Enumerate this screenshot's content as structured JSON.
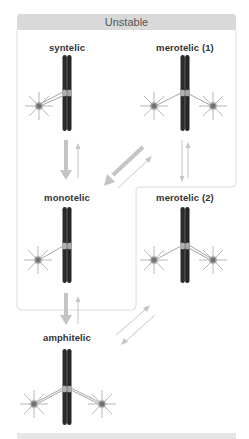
{
  "group": {
    "label": "Unstable",
    "header_color": "#d9d9d9",
    "border_color": "#dcdcdc"
  },
  "states": [
    {
      "id": "syntelic",
      "label": "syntelic",
      "group": "Unstable",
      "attachments": "both sister kinetochores attached to the same pole"
    },
    {
      "id": "merotelic-1",
      "label": "merotelic (1)",
      "group": "Unstable",
      "attachments": "one kinetochore attached to both poles"
    },
    {
      "id": "monotelic",
      "label": "monotelic",
      "group": "Unstable",
      "attachments": "one kinetochore attached to one pole"
    },
    {
      "id": "merotelic-2",
      "label": "merotelic (2)",
      "group": "Unstable",
      "attachments": "both kinetochores attached, one to both poles"
    },
    {
      "id": "amphitelic",
      "label": "amphitelic",
      "group": "Stable",
      "attachments": "sister kinetochores attached to opposite poles"
    }
  ],
  "transitions": [
    {
      "from": "syntelic",
      "to": "monotelic",
      "weight": "strong"
    },
    {
      "from": "monotelic",
      "to": "syntelic",
      "weight": "weak"
    },
    {
      "from": "merotelic-1",
      "to": "monotelic",
      "weight": "strong"
    },
    {
      "from": "monotelic",
      "to": "merotelic-1",
      "weight": "weak"
    },
    {
      "from": "merotelic-1",
      "to": "merotelic-2",
      "weight": "weak"
    },
    {
      "from": "merotelic-2",
      "to": "merotelic-1",
      "weight": "weak"
    },
    {
      "from": "monotelic",
      "to": "amphitelic",
      "weight": "strong"
    },
    {
      "from": "amphitelic",
      "to": "monotelic",
      "weight": "weak"
    },
    {
      "from": "merotelic-2",
      "to": "amphitelic",
      "weight": "weak"
    },
    {
      "from": "amphitelic",
      "to": "merotelic-2",
      "weight": "weak"
    }
  ],
  "colors": {
    "chromosome": "#2b2b2b",
    "kinetochore": "#a8a8a8",
    "microtubule": "#9a9a9a",
    "pole_center": "#8a8a8a",
    "arrow": "#c4c4c4"
  }
}
